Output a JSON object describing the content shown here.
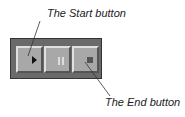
{
  "callouts": {
    "start": "The Start button",
    "end": "The End button"
  },
  "toolbar": {
    "buttons": [
      {
        "name": "start",
        "icon": "play-icon"
      },
      {
        "name": "pause",
        "icon": "pause-icon"
      },
      {
        "name": "end",
        "icon": "stop-icon"
      }
    ]
  }
}
